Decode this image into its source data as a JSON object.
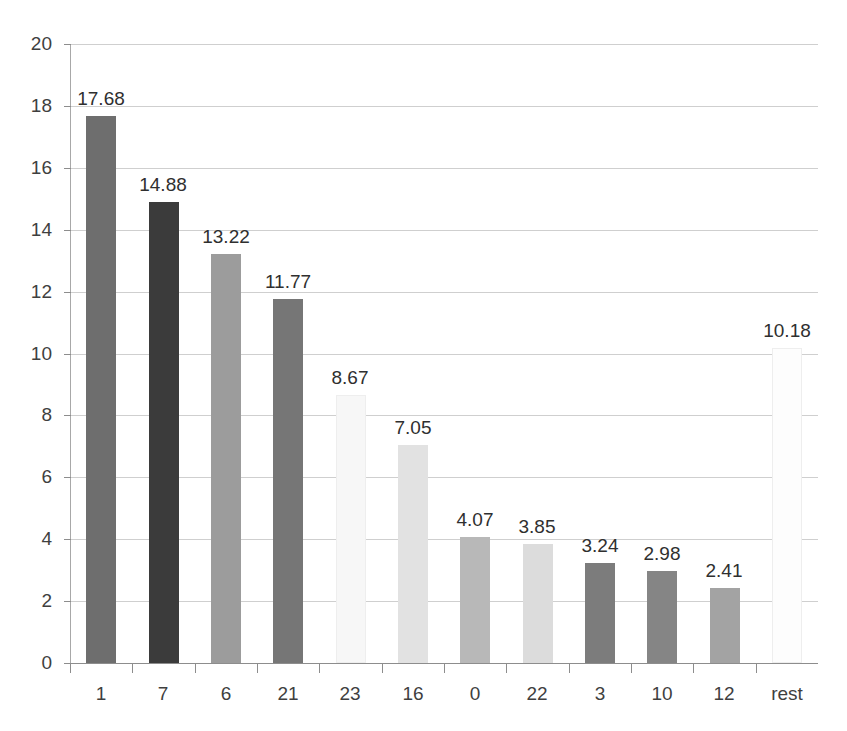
{
  "chart_data": {
    "type": "bar",
    "title": "",
    "subtitle": "",
    "xlabel": "",
    "ylabel": "",
    "categories": [
      "1",
      "7",
      "6",
      "21",
      "23",
      "16",
      "0",
      "22",
      "3",
      "10",
      "12",
      "rest"
    ],
    "values": [
      17.68,
      14.88,
      13.22,
      11.77,
      8.67,
      7.05,
      4.07,
      3.85,
      3.24,
      2.98,
      2.41,
      10.18
    ],
    "value_labels": [
      "17.68",
      "14.88",
      "13.22",
      "11.77",
      "8.67",
      "7.05",
      "4.07",
      "3.85",
      "3.24",
      "2.98",
      "2.41",
      "10.18"
    ],
    "bar_colors": [
      "#6e6e6e",
      "#3b3b3b",
      "#9c9c9c",
      "#767676",
      "#f7f7f7",
      "#e2e2e2",
      "#b8b8b8",
      "#dcdcdc",
      "#7c7c7c",
      "#858585",
      "#a3a3a3",
      "#fdfdfd"
    ],
    "ylim": [
      0,
      20
    ],
    "ytick_values": [
      0,
      2,
      4,
      6,
      8,
      10,
      12,
      14,
      16,
      18,
      20
    ],
    "ytick_labels": [
      "0",
      "2",
      "4",
      "6",
      "8",
      "10",
      "12",
      "14",
      "16",
      "18",
      "20"
    ],
    "grid": true,
    "grid_color": "#cfcfcf",
    "legend": "none",
    "background": "#ffffff",
    "axis_color": "#8d8d8d",
    "label_color": "#3f3f3f"
  },
  "artifacts": {
    "cropped_title_text": "",
    "note": ""
  }
}
